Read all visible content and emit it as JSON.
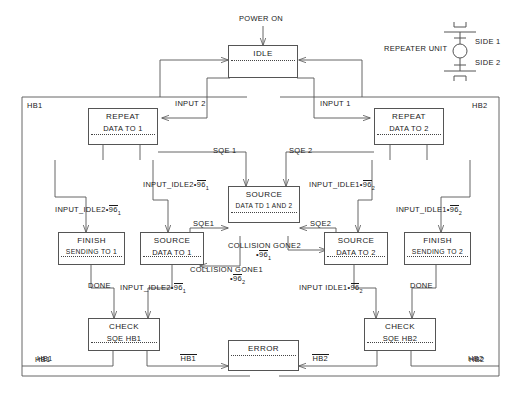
{
  "diagram": {
    "background": "#ffffff",
    "line_color": "#555555",
    "text_color": "#1a1a1a"
  },
  "legend": {
    "caption": "REPEATER UNIT",
    "side_1": "SIDE 1",
    "side_2": "SIDE 2"
  },
  "entry": {
    "power_on": "POWER ON"
  },
  "regions": {
    "left_top": "HB1",
    "right_top": "HB2",
    "left_bottom": "HB1",
    "right_bottom": "HB2"
  },
  "states": {
    "idle": {
      "line1": "IDLE",
      "line2": ""
    },
    "repeat_1": {
      "line1": "REPEAT",
      "line2": "DATA TO 1"
    },
    "repeat_2": {
      "line1": "REPEAT",
      "line2": "DATA TO 2"
    },
    "source_both": {
      "line1": "SOURCE",
      "line2": "DATA TD 1 AND 2"
    },
    "source_1": {
      "line1": "SOURCE",
      "line2": "DATA TO 1"
    },
    "source_2": {
      "line1": "SOURCE",
      "line2": "DATA TO 2"
    },
    "finish_1": {
      "line1": "FINISH",
      "line2": "SENDING TO 1"
    },
    "finish_2": {
      "line1": "FINISH",
      "line2": "SENDING TO 2"
    },
    "check_1": {
      "line1": "CHECK",
      "line2": "SQE HB1"
    },
    "check_2": {
      "line1": "CHECK",
      "line2": "SQE HB2"
    },
    "error": {
      "line1": "ERROR",
      "line2": ""
    }
  },
  "transitions": {
    "input_2": "INPUT 2",
    "input_1": "INPUT 1",
    "sqe_1": "SQE 1",
    "sqe_2": "SQE 2",
    "sqe1": "SQE1",
    "sqe2": "SQE2",
    "done_left": "DONE",
    "done_right": "DONE",
    "hb1_plain_left": "HB1",
    "hb2_plain_right": "HB2",
    "hb1_bar": "HB1",
    "hb2_bar": "HB2",
    "idle2_96_1_upper": {
      "text": "INPUT_IDLE2•96",
      "sub": "1"
    },
    "idle1_96_2_upper": {
      "text": "INPUT_IDLE1•96",
      "sub": "2"
    },
    "idle2_96_1_left": {
      "text": "INPUT_IDLE2•96",
      "sub": "1"
    },
    "idle1_96_2_right": {
      "text": "INPUT_IDLE1•96",
      "sub": "2"
    },
    "idle2_96_1_lower": {
      "text": "INPUT_IDLE2•96",
      "sub": "1"
    },
    "idle1_96_2_lower": {
      "text": "INPUT IDLE1•96",
      "sub": "2"
    },
    "collision_gone2": {
      "text": "COLLISION GONE2",
      "tail": "•96",
      "sub": "1"
    },
    "collision_gone1": {
      "text": "COLLISION GONE1",
      "tail": "•96",
      "sub": "2"
    }
  }
}
